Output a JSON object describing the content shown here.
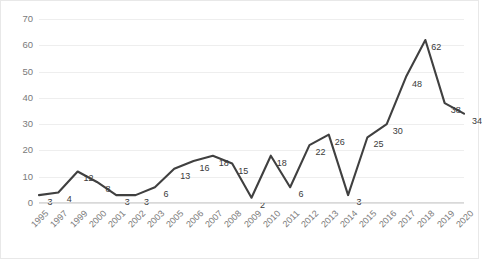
{
  "chart_data": {
    "type": "line",
    "title": "",
    "subtitle": "",
    "xlabel": "",
    "ylabel": "",
    "categories": [
      "1995",
      "1997",
      "1999",
      "2000",
      "2001",
      "2002",
      "2003",
      "2005",
      "2006",
      "2007",
      "2008",
      "2009",
      "2010",
      "2011",
      "2012",
      "2013",
      "2014",
      "2015",
      "2016",
      "2017",
      "2018",
      "2019",
      "2020"
    ],
    "values": [
      3,
      4,
      12,
      8,
      3,
      3,
      6,
      13,
      16,
      18,
      15,
      2,
      18,
      6,
      22,
      26,
      3,
      25,
      30,
      48,
      62,
      38,
      34
    ],
    "series": [
      {
        "name": "",
        "values": [
          3,
          4,
          12,
          8,
          3,
          3,
          6,
          13,
          16,
          18,
          15,
          2,
          18,
          6,
          22,
          26,
          3,
          25,
          30,
          48,
          62,
          38,
          34
        ]
      }
    ],
    "data_labels": [
      "3",
      "4",
      "12",
      "8",
      "3",
      "3",
      "6",
      "13",
      "16",
      "18",
      "15",
      "2",
      "18",
      "6",
      "22",
      "26",
      "3",
      "25",
      "30",
      "48",
      "62",
      "38",
      "34"
    ],
    "ylim": [
      0,
      70
    ],
    "y_ticks": [
      0,
      10,
      20,
      30,
      40,
      50,
      60,
      70
    ],
    "y_tick_labels": [
      "0",
      "10",
      "20",
      "30",
      "40",
      "50",
      "60",
      "70"
    ],
    "grid": true,
    "grid_axis": "y",
    "legend": false,
    "legend_position": "none",
    "markers": false,
    "line_color": "#404040",
    "grid_color": "#eeeeee",
    "label_color": "#3a3a3a",
    "tick_color": "#7a7a7a",
    "x_tick_rotation": -45
  }
}
